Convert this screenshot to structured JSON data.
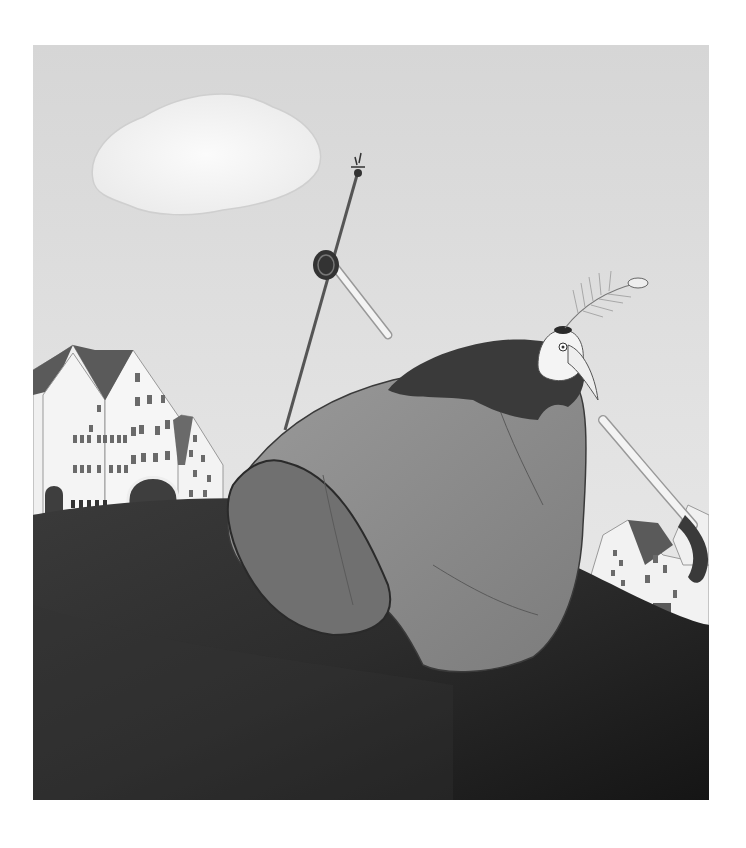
{
  "illustration": {
    "style": "grayscale watercolor",
    "colors": {
      "page_bg": "#ffffff",
      "sky_top": "#d8d8d8",
      "sky_bottom": "#ececec",
      "cloud": "#f8f8f8",
      "hill_dark": "#2a2a2a",
      "hill_mid": "#4a4a4a",
      "cloak": "#8c8c8c",
      "cloak_shadow": "#6e6e6e",
      "collar": "#3a3a3a",
      "house_wall": "#f2f2f2",
      "roof": "#5a5a5a",
      "window": "#6a6a6a"
    },
    "elements": [
      "cloud",
      "walking-stick",
      "left-town",
      "right-town",
      "cloaked-figure",
      "bird-head-with-feather",
      "dark-hill"
    ]
  }
}
